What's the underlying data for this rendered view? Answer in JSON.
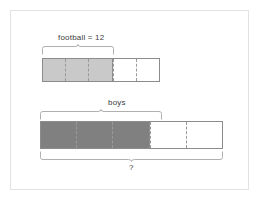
{
  "diagram": {
    "type": "bar-model",
    "title_visible": false,
    "background": "#ffffff",
    "frame_color": "#e2e2e2",
    "models": [
      {
        "id": "football-model",
        "label": "football = 12",
        "label_value": 12,
        "total_cells": 5,
        "filled_cells": 3,
        "empty_cells": 2,
        "fill_color": "#c9c9c9",
        "empty_color": "#ffffff",
        "border_color": "#8c8c8c",
        "brace_label": "football = 12",
        "brace_spans_cells": 3,
        "brace_position": "top"
      },
      {
        "id": "boys-model",
        "label": "boys",
        "total_cells": 5,
        "filled_cells": 3,
        "empty_cells": 2,
        "fill_color": "#808080",
        "empty_color": "#ffffff",
        "border_color": "#8c8c8c",
        "top_brace_label": "boys",
        "top_brace_spans_cells": 3,
        "bottom_brace_label": "?",
        "bottom_brace_spans_cells": 5
      }
    ]
  },
  "labels": {
    "football": "football = 12",
    "boys": "boys",
    "unknown": "?"
  }
}
